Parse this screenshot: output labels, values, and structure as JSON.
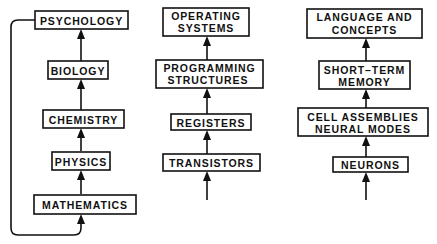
{
  "diagram": {
    "type": "hierarchy-of-levels",
    "columns": [
      {
        "name": "sciences",
        "levels_bottom_to_top": [
          "MATHEMATICS",
          "PHYSICS",
          "CHEMISTRY",
          "BIOLOGY",
          "PSYCHOLOGY"
        ],
        "feedback_loop": "PSYCHOLOGY → MATHEMATICS"
      },
      {
        "name": "computers",
        "levels_bottom_to_top": [
          "TRANSISTORS",
          "REGISTERS",
          "PROGRAMMING STRUCTURES",
          "OPERATING SYSTEMS"
        ]
      },
      {
        "name": "brain",
        "levels_bottom_to_top": [
          "NEURONS",
          "CELL ASSEMBLIES NEURAL MODES",
          "SHORT-TERM MEMORY",
          "LANGUAGE AND CONCEPTS"
        ]
      }
    ]
  },
  "col1": {
    "psychology": "PSYCHOLOGY",
    "biology": "BIOLOGY",
    "chemistry": "CHEMISTRY",
    "physics": "PHYSICS",
    "mathematics": "MATHEMATICS"
  },
  "col2": {
    "os_line1": "OPERATING",
    "os_line2": "SYSTEMS",
    "prog_line1": "PROGRAMMING",
    "prog_line2": "STRUCTURES",
    "registers": "REGISTERS",
    "transistors": "TRANSISTORS"
  },
  "col3": {
    "lang_line1": "LANGUAGE AND",
    "lang_line2": "CONCEPTS",
    "stm_line1": "SHORT–TERM",
    "stm_line2": "MEMORY",
    "cell_line1": "CELL ASSEMBLIES",
    "cell_line2": "NEURAL MODES",
    "neurons": "NEURONS"
  }
}
